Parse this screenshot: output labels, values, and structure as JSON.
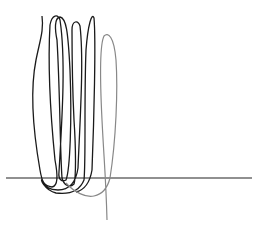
{
  "chart_data": {
    "type": "line",
    "title": "",
    "xlabel": "",
    "ylabel": "",
    "grid": false,
    "legend": null,
    "axis": {
      "baseline_y_px": 178,
      "x_from_px": 6,
      "x_to_px": 252,
      "color": "#222222"
    },
    "series": [
      {
        "name": "dark-spiral",
        "color": "#1a1a1a",
        "path": "M42,16 C44,30 40,40 36,60 C30,90 33,130 40,170 C42,182 44,186 52,187 C58,186 58,176 55,160 C50,110 48,60 50,25 C52,14 58,14 60,20 C66,60 62,120 59,172 C58,180 62,182 66,180 C70,170 72,120 70,70 C68,30 66,18 60,17 C54,18 55,30 57,40 C60,90 60,150 62,178 C64,186 70,188 74,184 C76,178 76,150 74,120 C72,80 72,40 72,30 C72,20 78,20 80,26 C84,60 80,120 78,168 C76,182 70,190 58,190 C48,190 44,186 42,180 C40,178 44,190 56,193 C72,195 80,190 84,180 C86,160 84,100 86,50 C88,24 92,12 94,18 C96,40 94,120 92,170 C90,182 84,190 76,192"
      },
      {
        "name": "gray-loop",
        "color": "#888888",
        "path": "M66,183 C74,192 86,198 94,196 C104,194 108,186 110,178 C116,140 118,90 116,60 C114,36 108,32 104,36 C100,44 100,80 102,120 C104,160 106,180 107,220"
      }
    ]
  }
}
